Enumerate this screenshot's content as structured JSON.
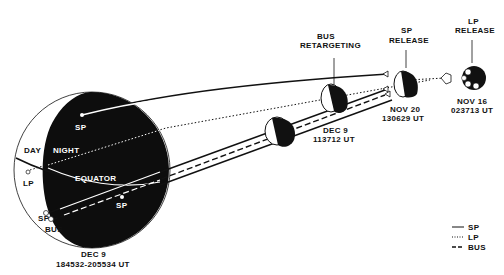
{
  "diagram": {
    "type": "spacecraft-trajectory",
    "colors": {
      "ink": "#111111",
      "paper": "#ffffff"
    }
  },
  "planet": {
    "day_label": "DAY",
    "night_label": "NIGHT",
    "equator_label": "EQUATOR",
    "sp_label_top": "SP",
    "sp_label_bottom": "SP",
    "lp_label": "LP",
    "sp_entry_label": "SP",
    "bus_entry_label": "BUS",
    "entry_date": "DEC 9",
    "entry_time": "184532-205534 UT"
  },
  "events": {
    "bus_retargeting": {
      "line1": "BUS",
      "line2": "RETARGETING"
    },
    "sp_release": {
      "line1": "SP",
      "line2": "RELEASE",
      "date": "NOV 20",
      "time": "130629 UT"
    },
    "lp_release": {
      "line1": "LP",
      "line2": "RELEASE",
      "date": "NOV 16",
      "time": "023713 UT"
    },
    "dec9_mid": {
      "date": "DEC 9",
      "time": "113712 UT"
    }
  },
  "legend": {
    "items": [
      {
        "style": "solid",
        "label": "SP"
      },
      {
        "style": "dotted",
        "label": "LP"
      },
      {
        "style": "dashed",
        "label": "BUS"
      }
    ]
  }
}
